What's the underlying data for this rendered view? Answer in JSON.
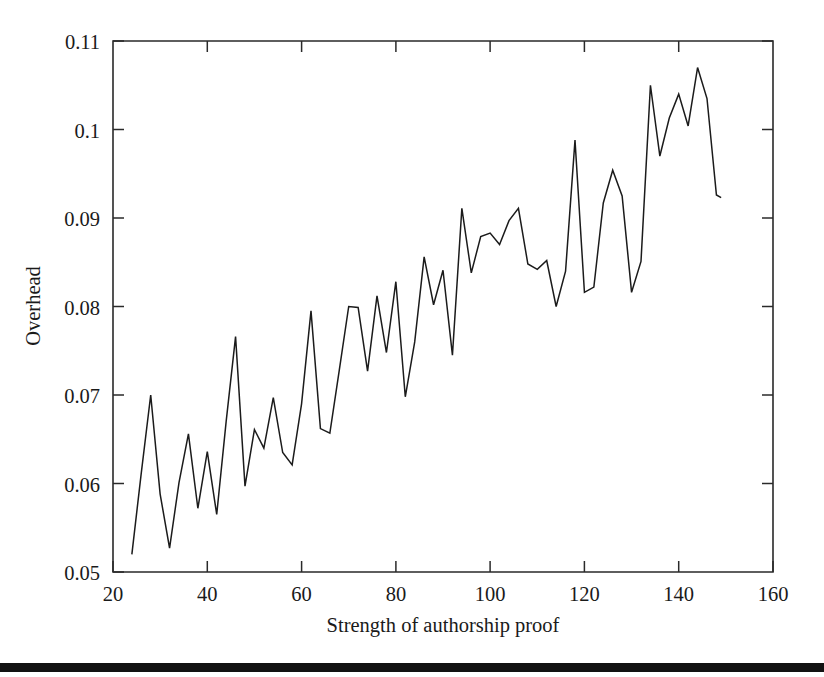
{
  "figure": {
    "background_color": "#ffffff",
    "line_color": "#1b1b1b",
    "axis_color": "#2a2a2a",
    "bottom_rule_color": "#121212"
  },
  "axes": {
    "y_title": "Overhead",
    "x_title": "Strength of authorship proof",
    "y_ticks": [
      "0.05",
      "0.06",
      "0.07",
      "0.08",
      "0.09",
      "0.1",
      "0.11"
    ],
    "x_ticks": [
      "20",
      "40",
      "60",
      "80",
      "100",
      "120",
      "140",
      "160"
    ]
  },
  "chart_data": {
    "type": "line",
    "title": "",
    "xlabel": "Strength of authorship proof",
    "ylabel": "Overhead",
    "xlim": [
      20,
      160
    ],
    "ylim": [
      0.05,
      0.11
    ],
    "xticks": [
      20,
      40,
      60,
      80,
      100,
      120,
      140,
      160
    ],
    "yticks": [
      0.05,
      0.06,
      0.07,
      0.08,
      0.09,
      0.1,
      0.11
    ],
    "grid": false,
    "legend": false,
    "series": [
      {
        "name": "Overhead",
        "x": [
          24,
          26,
          28,
          30,
          32,
          34,
          36,
          38,
          40,
          42,
          44,
          46,
          48,
          50,
          52,
          54,
          56,
          58,
          60,
          62,
          64,
          66,
          68,
          70,
          72,
          74,
          76,
          78,
          80,
          82,
          84,
          86,
          88,
          90,
          92,
          94,
          96,
          98,
          100,
          102,
          104,
          106,
          108,
          110,
          112,
          114,
          116,
          118,
          120,
          122,
          124,
          126,
          128,
          130,
          132,
          134,
          136,
          138,
          140,
          142,
          144,
          146,
          148,
          149
        ],
        "y": [
          0.052,
          0.0612,
          0.07,
          0.0588,
          0.0527,
          0.0601,
          0.0656,
          0.0572,
          0.0636,
          0.0565,
          0.067,
          0.0766,
          0.0597,
          0.0661,
          0.064,
          0.0697,
          0.0635,
          0.0621,
          0.069,
          0.0795,
          0.0662,
          0.0657,
          0.0728,
          0.08,
          0.0799,
          0.0727,
          0.0812,
          0.0748,
          0.0828,
          0.0698,
          0.076,
          0.0856,
          0.0802,
          0.0841,
          0.0745,
          0.0911,
          0.0838,
          0.0879,
          0.0883,
          0.087,
          0.0897,
          0.0911,
          0.0848,
          0.0842,
          0.0852,
          0.08,
          0.084,
          0.0988,
          0.0816,
          0.0822,
          0.0917,
          0.0954,
          0.0925,
          0.0816,
          0.0851,
          0.105,
          0.097,
          0.1013,
          0.104,
          0.1004,
          0.107,
          0.1035,
          0.0926,
          0.0923
        ]
      }
    ]
  }
}
